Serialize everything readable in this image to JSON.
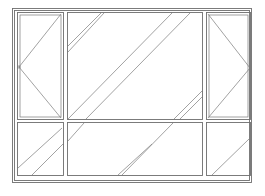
{
  "diagram": {
    "type": "window-elevation",
    "stroke_color": "#6e6e6e",
    "background": "#ffffff",
    "outer_frame": {
      "outer": [
        12,
        8,
        252,
        182
      ],
      "inner": [
        15,
        11,
        249,
        179
      ]
    },
    "panels": [
      {
        "id": "top-left-casement",
        "rect": [
          18,
          13,
          64,
          120
        ],
        "opening": "side-hung",
        "hinge_side": "right",
        "symbol": "triangle-apex-left"
      },
      {
        "id": "top-center-fixed",
        "rect": [
          67,
          13,
          203,
          120
        ],
        "opening": "fixed",
        "symbol": "glazing-hatch"
      },
      {
        "id": "top-right-casement",
        "rect": [
          206,
          13,
          251,
          120
        ],
        "opening": "side-hung",
        "hinge_side": "left",
        "symbol": "triangle-apex-right"
      },
      {
        "id": "bottom-left-fixed",
        "rect": [
          18,
          123,
          64,
          176
        ],
        "opening": "fixed",
        "symbol": "glazing-hatch"
      },
      {
        "id": "bottom-center-fixed",
        "rect": [
          67,
          123,
          203,
          176
        ],
        "opening": "fixed",
        "symbol": "glazing-hatch"
      },
      {
        "id": "bottom-right-fixed",
        "rect": [
          206,
          123,
          251,
          176
        ],
        "opening": "fixed",
        "symbol": "glazing-hatch"
      }
    ]
  }
}
